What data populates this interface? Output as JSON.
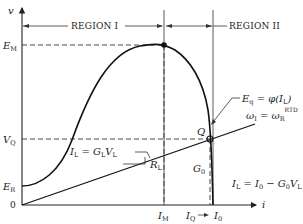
{
  "diagram": {
    "axes": {
      "y_label": "v",
      "x_label": "i",
      "origin_label": "0"
    },
    "y_ticks": [
      {
        "label": "E",
        "sub": "M",
        "y": 45
      },
      {
        "label": "V",
        "sub": "Q",
        "y": 139
      },
      {
        "label": "E",
        "sub": "R",
        "y": 186
      }
    ],
    "x_ticks": [
      {
        "label": "I",
        "sub": "M",
        "x": 164
      },
      {
        "label": "I",
        "sub": "Q",
        "x": 210
      },
      {
        "label": "I",
        "sub": "0",
        "x": 213
      }
    ],
    "regions": [
      {
        "label": "REGION I"
      },
      {
        "label": "REGION II"
      }
    ],
    "annotations": {
      "eq_curve_main": "E",
      "eq_curve_sub": "q",
      "eq_curve_rest": " = φ(I",
      "eq_curve_rest_sub": "L",
      "eq_curve_close": ")",
      "omega_main": "ω",
      "omega_sub": "I",
      "omega_eq": " = ω",
      "omega_sub2": "R",
      "omega_sup": "RTD",
      "load_line_label": "I",
      "load_line_sub": "L",
      "load_line_eq": " = G",
      "load_line_sub2": "L",
      "load_line_v": "V",
      "load_line_sub3": "L",
      "rl_label": "R",
      "rl_sub": "L",
      "q_label": "Q",
      "g0_label": "G",
      "g0_sub": "0",
      "source_eq_1": "I",
      "source_eq_sub1": "L",
      "source_eq_2": " = I",
      "source_eq_sub2": "0",
      "source_eq_3": " − G",
      "source_eq_sub3": "0",
      "source_eq_4": "V",
      "source_eq_sub4": "L"
    }
  }
}
